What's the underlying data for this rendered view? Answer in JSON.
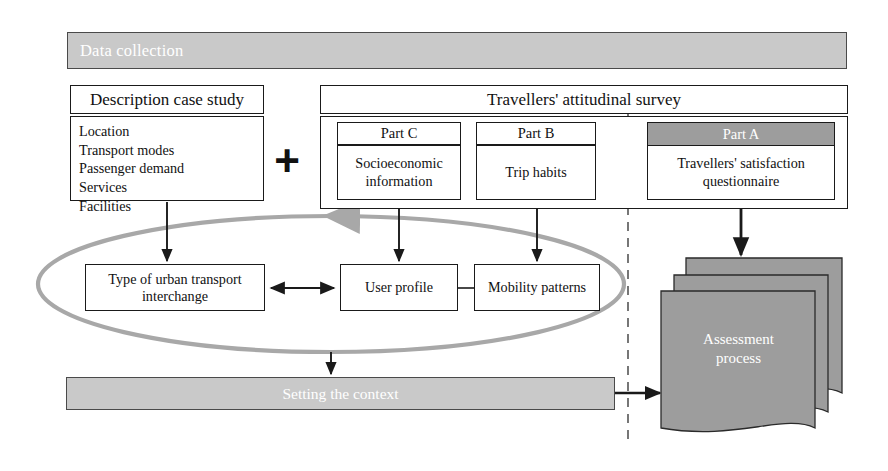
{
  "diagram": {
    "top_bar": {
      "label": "Data collection"
    },
    "description": {
      "title": "Description case study",
      "items": [
        "Location",
        "Transport modes",
        "Passenger demand",
        "Services",
        "Facilities"
      ]
    },
    "combine_operator": "+",
    "survey": {
      "title": "Travellers' attitudinal survey",
      "parts": [
        {
          "header": "Part C",
          "body": "Socioeconomic information",
          "shaded": false
        },
        {
          "header": "Part B",
          "body": "Trip habits",
          "shaded": false
        },
        {
          "header": "Part A",
          "body": "Travellers' satisfaction questionnaire",
          "shaded": true
        }
      ]
    },
    "middle_nodes": [
      {
        "label": "Type of urban transport interchange"
      },
      {
        "label": "User profile"
      },
      {
        "label": "Mobility patterns"
      }
    ],
    "bottom_bar": {
      "label": "Setting the context"
    },
    "assessment": {
      "label_line1": "Assessment",
      "label_line2": "process"
    },
    "colors": {
      "band_fill": "#c9c9c9",
      "band_text": "#ffffff",
      "part_a_header_fill": "#9d9d9d",
      "loop_stroke": "#a8a8a8",
      "document_fill": "#9d9d9d",
      "line": "#1a1a1a",
      "divider": "#555555"
    }
  }
}
